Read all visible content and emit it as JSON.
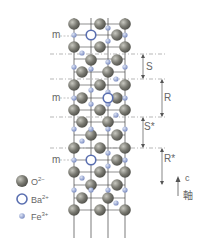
{
  "diagram": {
    "mirror_label": "m",
    "blocks": [
      {
        "id": "S",
        "label": "S"
      },
      {
        "id": "R",
        "label": "R"
      },
      {
        "id": "S*",
        "label": "S*"
      },
      {
        "id": "R*",
        "label": "R*"
      }
    ],
    "axis": {
      "label_top": "c",
      "label_bottom": "軸"
    },
    "legend": [
      {
        "ion": "O",
        "charge": "2−",
        "symbol": "filled-gray-sphere",
        "color": "#7a7a72"
      },
      {
        "ion": "Ba",
        "charge": "2+",
        "symbol": "hollow-blue-ring",
        "color": "#5a6fb0"
      },
      {
        "ion": "Fe",
        "charge": "3+",
        "symbol": "small-blue-dot",
        "color": "#8a9ccc"
      }
    ],
    "colors": {
      "oxygen": "#7a7a72",
      "barium": "#5a6fb0",
      "iron": "#8a9ccc",
      "lines": "#444444",
      "dashed": "#999999"
    }
  }
}
